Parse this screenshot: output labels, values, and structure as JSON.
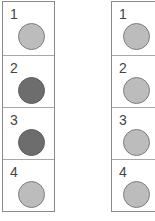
{
  "panels": [
    {
      "id": "left",
      "cells": [
        {
          "label": "1",
          "state": "light"
        },
        {
          "label": "2",
          "state": "dark"
        },
        {
          "label": "3",
          "state": "dark"
        },
        {
          "label": "4",
          "state": "light"
        }
      ]
    },
    {
      "id": "right",
      "cells": [
        {
          "label": "1",
          "state": "light"
        },
        {
          "label": "2",
          "state": "light"
        },
        {
          "label": "3",
          "state": "light"
        },
        {
          "label": "4",
          "state": "light"
        }
      ]
    }
  ],
  "colors": {
    "light": "#bcbcbc",
    "dark": "#6d6d6d",
    "border": "#8a8a8a"
  }
}
